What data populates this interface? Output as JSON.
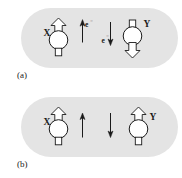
{
  "figure": {
    "type": "diagram",
    "background_color": "#ffffff",
    "panel_fill_color": "#e4e4e4",
    "stroke_color": "#1a1a1a",
    "arrow_fill_color": "#ffffff",
    "panels": [
      {
        "id": "a",
        "caption": "(a)",
        "atoms": [
          {
            "id": "X",
            "label": "X",
            "label_side": "left",
            "top_marker": "hollow-arrow-up",
            "bottom_marker": "hollow-rectangle",
            "spin": "up"
          },
          {
            "id": "Y",
            "label": "Y",
            "label_side": "right",
            "top_marker": "hollow-rectangle",
            "bottom_marker": "hollow-arrow-down",
            "spin": "down"
          }
        ],
        "electron_arrows": [
          {
            "direction": "up",
            "label": "e⁻",
            "label_position": "top-right"
          },
          {
            "direction": "down",
            "label": "e⁻",
            "label_position": "bottom-left"
          }
        ]
      },
      {
        "id": "b",
        "caption": "(b)",
        "atoms": [
          {
            "id": "X",
            "label": "X",
            "label_side": "left",
            "top_marker": "hollow-arrow-up",
            "bottom_marker": "hollow-rectangle",
            "spin": "up"
          },
          {
            "id": "Y",
            "label": "Y",
            "label_side": "right",
            "top_marker": "hollow-arrow-up",
            "bottom_marker": "hollow-rectangle",
            "spin": "up"
          }
        ],
        "electron_arrows": [
          {
            "direction": "up",
            "label": "",
            "label_position": "none"
          },
          {
            "direction": "down",
            "label": "",
            "label_position": "none"
          }
        ]
      }
    ]
  }
}
